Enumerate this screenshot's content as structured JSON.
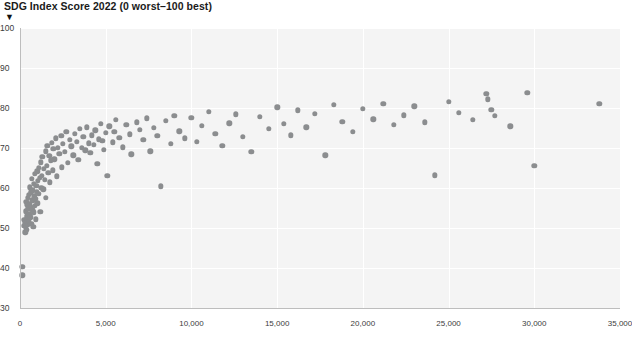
{
  "chart_data": {
    "type": "scatter",
    "title": "SDG Index Score 2022 (0 worst–100 best)",
    "title_marker": "▼",
    "xlabel": "",
    "ylabel": "",
    "xlim": [
      0,
      35000
    ],
    "ylim": [
      30,
      100
    ],
    "grid": true,
    "legend": "none",
    "x_ticks": [
      "0",
      "5,000",
      "10,000",
      "15,000",
      "20,000",
      "25,000",
      "30,000",
      "35,000"
    ],
    "x_tick_values": [
      0,
      5000,
      10000,
      15000,
      20000,
      25000,
      30000,
      35000
    ],
    "y_ticks": [
      "100",
      "90",
      "80",
      "70",
      "60",
      "50",
      "40",
      "30"
    ],
    "y_tick_values": [
      100,
      90,
      80,
      70,
      60,
      50,
      40,
      30
    ],
    "marker_color": "#8b8d8f",
    "plot_background": "#f4f4f4",
    "gridline_color": "#ffffff",
    "points": [
      [
        130,
        40.3
      ],
      [
        140,
        38.2
      ],
      [
        250,
        50.5
      ],
      [
        260,
        52.0
      ],
      [
        300,
        48.9
      ],
      [
        320,
        51.3
      ],
      [
        330,
        54.2
      ],
      [
        350,
        50.0
      ],
      [
        360,
        56.5
      ],
      [
        380,
        53.1
      ],
      [
        400,
        49.6
      ],
      [
        410,
        55.8
      ],
      [
        430,
        52.4
      ],
      [
        450,
        57.6
      ],
      [
        460,
        50.8
      ],
      [
        480,
        54.9
      ],
      [
        500,
        51.8
      ],
      [
        520,
        58.3
      ],
      [
        540,
        53.6
      ],
      [
        560,
        56.1
      ],
      [
        580,
        60.2
      ],
      [
        600,
        52.7
      ],
      [
        620,
        55.3
      ],
      [
        640,
        58.9
      ],
      [
        660,
        51.0
      ],
      [
        680,
        57.0
      ],
      [
        700,
        62.3
      ],
      [
        720,
        54.5
      ],
      [
        740,
        59.4
      ],
      [
        760,
        56.8
      ],
      [
        780,
        50.3
      ],
      [
        800,
        61.0
      ],
      [
        820,
        53.9
      ],
      [
        840,
        58.0
      ],
      [
        860,
        55.5
      ],
      [
        880,
        63.5
      ],
      [
        900,
        57.3
      ],
      [
        920,
        52.2
      ],
      [
        950,
        60.6
      ],
      [
        980,
        59.0
      ],
      [
        1000,
        64.2
      ],
      [
        1020,
        56.2
      ],
      [
        1050,
        61.8
      ],
      [
        1080,
        58.5
      ],
      [
        1100,
        65.0
      ],
      [
        1150,
        62.6
      ],
      [
        1180,
        54.1
      ],
      [
        1200,
        66.4
      ],
      [
        1250,
        60.0
      ],
      [
        1280,
        63.1
      ],
      [
        1300,
        67.8
      ],
      [
        1350,
        59.7
      ],
      [
        1400,
        64.8
      ],
      [
        1450,
        62.0
      ],
      [
        1500,
        69.2
      ],
      [
        1520,
        57.5
      ],
      [
        1560,
        65.6
      ],
      [
        1600,
        70.5
      ],
      [
        1650,
        63.8
      ],
      [
        1700,
        68.1
      ],
      [
        1750,
        61.4
      ],
      [
        1800,
        66.9
      ],
      [
        1850,
        71.3
      ],
      [
        1900,
        64.4
      ],
      [
        1950,
        69.8
      ],
      [
        2000,
        67.2
      ],
      [
        2100,
        72.4
      ],
      [
        2150,
        62.9
      ],
      [
        2200,
        70.1
      ],
      [
        2300,
        68.6
      ],
      [
        2400,
        73.0
      ],
      [
        2450,
        65.2
      ],
      [
        2500,
        71.0
      ],
      [
        2600,
        69.0
      ],
      [
        2700,
        74.1
      ],
      [
        2800,
        66.3
      ],
      [
        2900,
        72.0
      ],
      [
        3000,
        70.4
      ],
      [
        3100,
        68.2
      ],
      [
        3200,
        73.6
      ],
      [
        3300,
        71.6
      ],
      [
        3400,
        67.0
      ],
      [
        3500,
        74.8
      ],
      [
        3600,
        70.0
      ],
      [
        3700,
        72.8
      ],
      [
        3800,
        69.4
      ],
      [
        3900,
        75.2
      ],
      [
        4000,
        71.2
      ],
      [
        4100,
        68.8
      ],
      [
        4200,
        73.2
      ],
      [
        4300,
        70.8
      ],
      [
        4400,
        74.4
      ],
      [
        4500,
        66.0
      ],
      [
        4600,
        72.2
      ],
      [
        4700,
        76.0
      ],
      [
        4800,
        71.8
      ],
      [
        4900,
        69.6
      ],
      [
        5000,
        73.8
      ],
      [
        5100,
        63.0
      ],
      [
        5200,
        75.4
      ],
      [
        5400,
        71.4
      ],
      [
        5500,
        74.0
      ],
      [
        5600,
        77.0
      ],
      [
        5800,
        72.6
      ],
      [
        6000,
        70.2
      ],
      [
        6200,
        75.8
      ],
      [
        6400,
        73.4
      ],
      [
        6500,
        68.4
      ],
      [
        6800,
        76.4
      ],
      [
        7000,
        74.6
      ],
      [
        7200,
        72.0
      ],
      [
        7400,
        77.4
      ],
      [
        7600,
        69.2
      ],
      [
        7800,
        75.0
      ],
      [
        8000,
        73.0
      ],
      [
        8200,
        60.4
      ],
      [
        8500,
        76.8
      ],
      [
        8800,
        71.0
      ],
      [
        9000,
        78.0
      ],
      [
        9300,
        74.2
      ],
      [
        9600,
        72.4
      ],
      [
        10000,
        77.6
      ],
      [
        10300,
        71.6
      ],
      [
        10600,
        75.6
      ],
      [
        11000,
        79.0
      ],
      [
        11400,
        73.6
      ],
      [
        11800,
        70.6
      ],
      [
        12200,
        76.2
      ],
      [
        12600,
        78.4
      ],
      [
        13000,
        72.8
      ],
      [
        13500,
        69.0
      ],
      [
        14000,
        77.8
      ],
      [
        14500,
        74.8
      ],
      [
        15000,
        80.2
      ],
      [
        15400,
        76.0
      ],
      [
        15800,
        73.2
      ],
      [
        16200,
        79.4
      ],
      [
        16700,
        75.2
      ],
      [
        17200,
        78.6
      ],
      [
        17800,
        68.2
      ],
      [
        18300,
        80.8
      ],
      [
        18800,
        76.6
      ],
      [
        19400,
        74.0
      ],
      [
        20000,
        79.8
      ],
      [
        20600,
        77.2
      ],
      [
        21200,
        81.0
      ],
      [
        21800,
        75.8
      ],
      [
        22400,
        78.2
      ],
      [
        23000,
        80.4
      ],
      [
        23600,
        76.4
      ],
      [
        24200,
        63.2
      ],
      [
        25000,
        81.6
      ],
      [
        25600,
        78.8
      ],
      [
        26400,
        77.0
      ],
      [
        27200,
        83.6
      ],
      [
        27300,
        82.2
      ],
      [
        27500,
        79.6
      ],
      [
        27700,
        78.0
      ],
      [
        28600,
        75.4
      ],
      [
        29600,
        83.8
      ],
      [
        30000,
        65.6
      ],
      [
        33800,
        81.0
      ]
    ]
  }
}
